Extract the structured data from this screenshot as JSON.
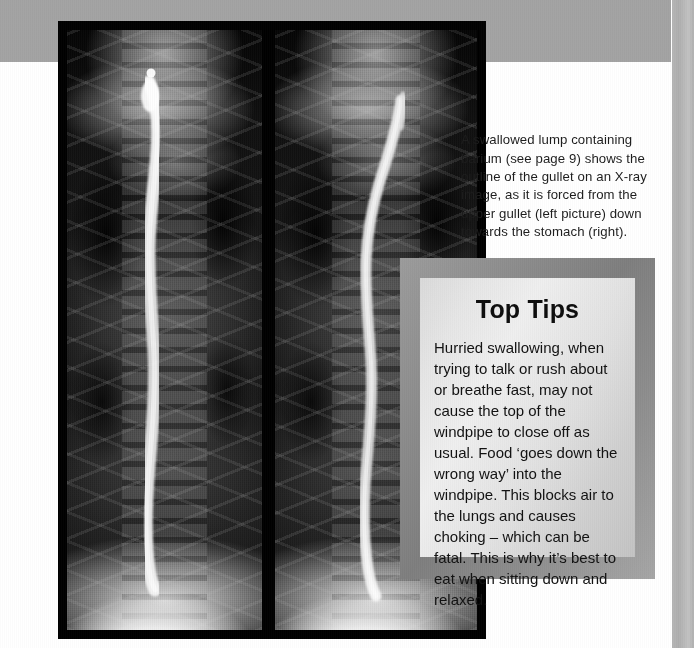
{
  "page": {
    "background_color": "#ffffff",
    "frame_band_color": "#a3a3a3"
  },
  "figure": {
    "name": "barium-swallow-xray",
    "alt": "Two black-and-white X-ray images of the chest showing a barium-coated swallowed lump outlining the gullet",
    "panel_left_label": "upper gullet",
    "panel_right_label": "towards the stomach",
    "background_color": "#000000"
  },
  "caption": {
    "text": "A swallowed lump containing barium (see page 9) shows the outline of the gullet on an X-ray image, as it is forced from the upper gullet (left picture) down towards the stomach (right)."
  },
  "tips_box": {
    "title": "Top Tips",
    "body": "Hurried swallowing, when trying to talk or rush about or breathe fast, may not cause the top of the windpipe to close off as usual. Food ‘goes down the wrong way’ into the windpipe. This blocks air to the lungs and causes choking – which can be fatal. This is why it’s best to eat when sitting down and relaxed.",
    "border_color": "#8e8e8e",
    "panel_color": "#e4e4e4",
    "title_color": "#0d0d0d",
    "body_color": "#111111"
  }
}
